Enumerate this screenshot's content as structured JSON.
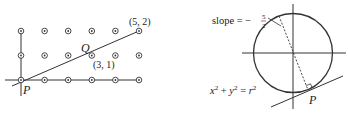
{
  "left_figure": {
    "grid": {
      "columns": [
        0,
        1,
        2,
        3,
        4,
        5
      ],
      "rows": [
        0,
        1,
        2
      ],
      "marker": "circled-dot"
    },
    "labels": {
      "P": "P",
      "Q": "Q",
      "point_3_1": "(3, 1)",
      "point_5_2": "(5, 2)"
    }
  },
  "right_figure": {
    "labels": {
      "slope_prefix": "slope = −",
      "slope_num": "5",
      "slope_den": "2",
      "eq_x": "x",
      "eq_plus": " + ",
      "eq_y": "y",
      "eq_equals": " = ",
      "eq_r": "r",
      "exp": "2",
      "P": "P"
    }
  },
  "colors": {
    "ink": "#222222",
    "background": "#ffffff"
  }
}
